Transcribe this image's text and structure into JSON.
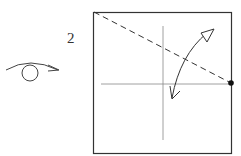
{
  "diagram": {
    "type": "origami-step",
    "step_number": "2",
    "symbols": {
      "turn_over": "turn-over-arrow",
      "fold_and_unfold": "fold-unfold-arrow",
      "valley_fold_line": "dashed-line",
      "reference_point": "dot"
    },
    "colors": {
      "line": "#333333",
      "background": "#ffffff"
    }
  }
}
